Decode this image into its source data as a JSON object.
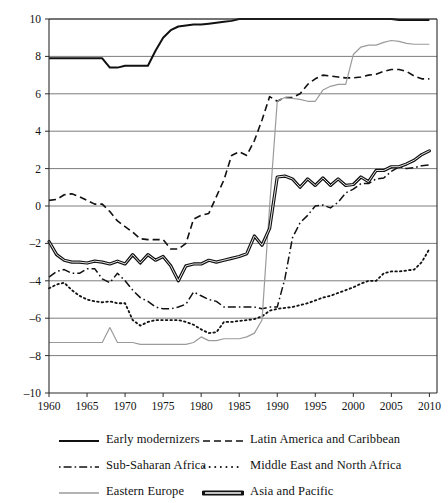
{
  "chart_data": {
    "type": "line",
    "title": "",
    "subtitle": "",
    "xlabel": "",
    "ylabel": "",
    "xlim": [
      1960,
      2011
    ],
    "ylim": [
      -10,
      10
    ],
    "grid": true,
    "legend_position": "bottom",
    "x_ticks": [
      "1960",
      "1965",
      "1970",
      "1975",
      "1980",
      "1985",
      "1990",
      "1995",
      "2000",
      "2005",
      "2010"
    ],
    "y_ticks": [
      "10",
      "8",
      "6",
      "4",
      "2",
      "0",
      "-2",
      "-4",
      "-6",
      "-8",
      "-10"
    ],
    "x": [
      1960,
      1961,
      1962,
      1963,
      1964,
      1965,
      1966,
      1967,
      1968,
      1969,
      1970,
      1971,
      1972,
      1973,
      1974,
      1975,
      1976,
      1977,
      1978,
      1979,
      1980,
      1981,
      1982,
      1983,
      1984,
      1985,
      1986,
      1987,
      1988,
      1989,
      1990,
      1991,
      1992,
      1993,
      1994,
      1995,
      1996,
      1997,
      1998,
      1999,
      2000,
      2001,
      2002,
      2003,
      2004,
      2005,
      2006,
      2007,
      2008,
      2009,
      2010
    ],
    "series": [
      {
        "name": "Early modernizers",
        "style": "solid",
        "color": "#111111",
        "width": 2.0,
        "values": [
          7.9,
          7.9,
          7.9,
          7.9,
          7.9,
          7.9,
          7.9,
          7.9,
          7.4,
          7.4,
          7.5,
          7.5,
          7.5,
          7.5,
          8.3,
          9.0,
          9.4,
          9.6,
          9.65,
          9.7,
          9.7,
          9.75,
          9.8,
          9.85,
          9.9,
          10.0,
          10.0,
          10.0,
          10.0,
          10.0,
          10.0,
          10.0,
          10.0,
          10.0,
          10.0,
          10.0,
          10.0,
          10.0,
          10.0,
          10.0,
          10.0,
          10.0,
          10.0,
          10.0,
          10.0,
          10.0,
          9.95,
          9.95,
          9.95,
          9.95,
          9.95
        ]
      },
      {
        "name": "Latin America and Caribbean",
        "style": "dashed",
        "color": "#111111",
        "width": 1.6,
        "values": [
          0.3,
          0.35,
          0.6,
          0.65,
          0.5,
          0.3,
          0.1,
          0.1,
          -0.3,
          -0.8,
          -1.1,
          -1.4,
          -1.75,
          -1.8,
          -1.8,
          -1.8,
          -2.3,
          -2.3,
          -2.0,
          -0.7,
          -0.5,
          -0.4,
          0.5,
          1.4,
          2.7,
          2.9,
          2.7,
          3.5,
          4.6,
          5.85,
          5.6,
          5.8,
          5.8,
          6.0,
          6.5,
          6.8,
          7.0,
          6.95,
          6.9,
          6.85,
          6.85,
          6.9,
          7.0,
          7.05,
          7.2,
          7.3,
          7.3,
          7.2,
          6.95,
          6.8,
          6.8
        ]
      },
      {
        "name": "Sub-Saharan Africa",
        "style": "dashdot",
        "color": "#111111",
        "width": 1.5,
        "values": [
          -3.8,
          -3.5,
          -3.4,
          -3.6,
          -3.6,
          -3.35,
          -3.35,
          -3.9,
          -4.1,
          -3.6,
          -4.0,
          -4.5,
          -4.9,
          -5.1,
          -5.4,
          -5.5,
          -5.5,
          -5.4,
          -5.25,
          -4.6,
          -4.8,
          -5.0,
          -5.1,
          -5.4,
          -5.4,
          -5.4,
          -5.4,
          -5.4,
          -5.5,
          -5.4,
          -5.4,
          -3.9,
          -1.7,
          -0.9,
          -0.5,
          0.0,
          0.05,
          -0.1,
          0.2,
          0.7,
          0.9,
          1.2,
          1.2,
          1.45,
          1.5,
          1.85,
          2.1,
          2.0,
          2.05,
          2.15,
          2.2
        ]
      },
      {
        "name": "Middle East and North Africa",
        "style": "dotted",
        "color": "#111111",
        "width": 1.8,
        "values": [
          -4.4,
          -4.2,
          -4.1,
          -4.5,
          -4.8,
          -5.0,
          -5.1,
          -5.15,
          -5.1,
          -5.2,
          -5.2,
          -6.1,
          -6.4,
          -6.2,
          -6.1,
          -6.1,
          -6.1,
          -6.1,
          -6.2,
          -6.35,
          -6.6,
          -6.8,
          -6.75,
          -6.2,
          -6.2,
          -6.15,
          -6.1,
          -6.05,
          -5.9,
          -5.6,
          -5.5,
          -5.45,
          -5.4,
          -5.3,
          -5.2,
          -5.05,
          -4.9,
          -4.8,
          -4.65,
          -4.5,
          -4.35,
          -4.15,
          -4.0,
          -4.0,
          -3.6,
          -3.5,
          -3.5,
          -3.45,
          -3.4,
          -3.0,
          -2.3
        ]
      },
      {
        "name": "Eastern Europe",
        "style": "solid",
        "color": "#9b9b9b",
        "width": 1.2,
        "values": [
          -7.3,
          -7.3,
          -7.3,
          -7.3,
          -7.3,
          -7.3,
          -7.3,
          -7.3,
          -6.5,
          -7.3,
          -7.3,
          -7.3,
          -7.4,
          -7.4,
          -7.4,
          -7.4,
          -7.4,
          -7.4,
          -7.4,
          -7.3,
          -7.0,
          -7.2,
          -7.2,
          -7.1,
          -7.1,
          -7.1,
          -7.0,
          -6.8,
          -6.1,
          0.0,
          5.6,
          5.8,
          5.75,
          5.7,
          5.6,
          5.6,
          6.2,
          6.4,
          6.5,
          6.5,
          8.1,
          8.5,
          8.6,
          8.6,
          8.75,
          8.85,
          8.8,
          8.7,
          8.65,
          8.65,
          8.65
        ]
      },
      {
        "name": "Asia and Pacific",
        "style": "thick-double",
        "color": "#111111",
        "width": 3.2,
        "values": [
          -1.9,
          -2.6,
          -2.9,
          -3.0,
          -3.0,
          -3.05,
          -2.95,
          -3.0,
          -3.1,
          -2.95,
          -3.1,
          -2.6,
          -3.05,
          -2.6,
          -2.9,
          -2.7,
          -3.2,
          -4.0,
          -3.2,
          -3.1,
          -3.1,
          -2.9,
          -3.0,
          -2.9,
          -2.8,
          -2.7,
          -2.55,
          -1.6,
          -2.1,
          -1.2,
          1.55,
          1.6,
          1.45,
          1.0,
          1.45,
          1.1,
          1.5,
          1.1,
          1.45,
          1.1,
          1.15,
          1.55,
          1.3,
          1.9,
          1.9,
          2.1,
          2.1,
          2.25,
          2.45,
          2.75,
          2.95
        ]
      }
    ]
  },
  "legend": {
    "items": [
      {
        "label": "Early modernizers",
        "swatch": "legend-swatch-solid-dark",
        "column": "left"
      },
      {
        "label": "Latin America and Caribbean",
        "swatch": "legend-swatch-dashed",
        "column": "right"
      },
      {
        "label": "Sub-Saharan Africa",
        "swatch": "legend-swatch-dashdot",
        "column": "left"
      },
      {
        "label": "Middle East and North Africa",
        "swatch": "legend-swatch-dotted",
        "column": "right"
      },
      {
        "label": "Eastern Europe",
        "swatch": "legend-swatch-solid-gray",
        "column": "left"
      },
      {
        "label": "Asia and Pacific",
        "swatch": "legend-swatch-thick",
        "column": "right"
      }
    ]
  }
}
